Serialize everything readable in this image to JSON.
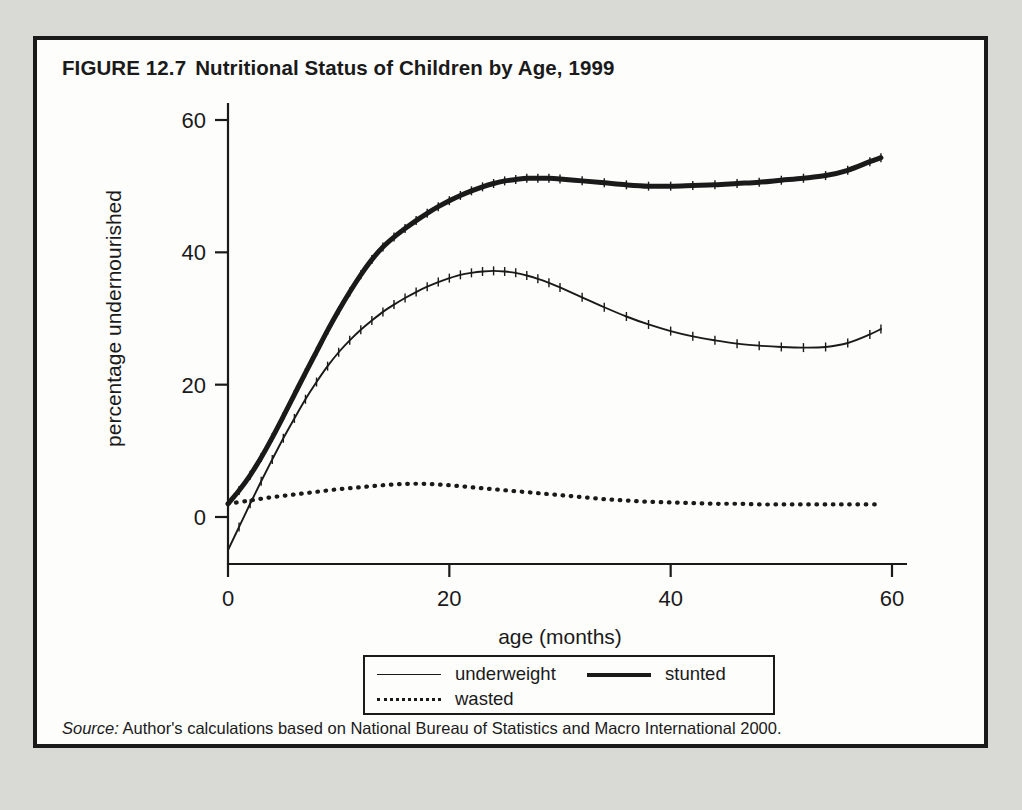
{
  "figure": {
    "number": "FIGURE 12.7",
    "title": "Nutritional Status of Children by Age, 1999",
    "source_word": "Source:",
    "source_text": " Author's calculations based on National Bureau of Statistics and Macro International 2000."
  },
  "legend": {
    "items": [
      {
        "label": "underweight",
        "style": "thin-solid"
      },
      {
        "label": "stunted",
        "style": "thick-solid"
      },
      {
        "label": "wasted",
        "style": "dotted"
      }
    ]
  },
  "colors": {
    "ink": "#1a1a1a",
    "page_background": "#d9d9d5",
    "figure_background": "#fdfdfc"
  },
  "chart_data": {
    "type": "line",
    "title": "Nutritional Status of Children by Age, 1999",
    "xlabel": "age (months)",
    "ylabel": "percentage undernourished",
    "xlim": [
      0,
      60
    ],
    "ylim": [
      -7,
      62
    ],
    "xticks": [
      0,
      20,
      40,
      60
    ],
    "yticks": [
      0,
      20,
      40,
      60
    ],
    "xtick_labels": [
      "0",
      "20",
      "40",
      "60"
    ],
    "ytick_labels": [
      "0",
      "20",
      "40",
      "60"
    ],
    "grid": false,
    "legend_position": "below-axes",
    "axes_spines": [
      "left",
      "bottom"
    ],
    "error_ticks": true,
    "series": [
      {
        "name": "stunted",
        "style": "thick-solid",
        "x": [
          0,
          1,
          2,
          3,
          4,
          5,
          6,
          7,
          8,
          9,
          10,
          11,
          12,
          13,
          14,
          15,
          16,
          17,
          18,
          19,
          20,
          21,
          22,
          23,
          24,
          25,
          26,
          27,
          28,
          29,
          30,
          32,
          34,
          36,
          38,
          40,
          42,
          44,
          46,
          48,
          50,
          52,
          54,
          56,
          58,
          59
        ],
        "values": [
          2.0,
          4.0,
          6.3,
          9.0,
          12.0,
          15.2,
          18.5,
          21.8,
          25.0,
          28.2,
          31.2,
          34.0,
          36.6,
          38.9,
          40.8,
          42.3,
          43.6,
          44.8,
          45.9,
          46.9,
          47.8,
          48.6,
          49.3,
          49.9,
          50.4,
          50.8,
          51.0,
          51.2,
          51.2,
          51.2,
          51.1,
          50.8,
          50.5,
          50.2,
          50.0,
          50.0,
          50.1,
          50.2,
          50.4,
          50.6,
          50.9,
          51.2,
          51.6,
          52.4,
          53.7,
          54.3
        ]
      },
      {
        "name": "underweight",
        "style": "thin-solid",
        "x": [
          0,
          1,
          2,
          3,
          4,
          5,
          6,
          7,
          8,
          9,
          10,
          11,
          12,
          13,
          14,
          15,
          16,
          17,
          18,
          19,
          20,
          21,
          22,
          23,
          24,
          25,
          26,
          27,
          28,
          29,
          30,
          32,
          34,
          36,
          38,
          40,
          42,
          44,
          46,
          48,
          50,
          52,
          54,
          56,
          58,
          59
        ],
        "values": [
          -5.0,
          -1.5,
          2.0,
          5.4,
          8.7,
          11.9,
          14.9,
          17.8,
          20.4,
          22.8,
          24.9,
          26.7,
          28.3,
          29.7,
          31.0,
          32.1,
          33.1,
          34.0,
          34.8,
          35.5,
          36.1,
          36.6,
          36.9,
          37.1,
          37.2,
          37.1,
          36.9,
          36.5,
          36.0,
          35.4,
          34.7,
          33.2,
          31.7,
          30.3,
          29.1,
          28.1,
          27.3,
          26.7,
          26.2,
          25.9,
          25.7,
          25.6,
          25.7,
          26.3,
          27.6,
          28.4
        ]
      },
      {
        "name": "wasted",
        "style": "dotted",
        "x": [
          0,
          2,
          4,
          6,
          8,
          10,
          12,
          14,
          16,
          18,
          20,
          22,
          24,
          26,
          28,
          30,
          32,
          34,
          36,
          38,
          40,
          42,
          44,
          46,
          48,
          50,
          52,
          54,
          56,
          58,
          59
        ],
        "values": [
          2.0,
          2.5,
          3.0,
          3.4,
          3.8,
          4.2,
          4.5,
          4.8,
          5.0,
          5.0,
          4.8,
          4.5,
          4.2,
          3.9,
          3.6,
          3.3,
          3.0,
          2.7,
          2.5,
          2.3,
          2.2,
          2.1,
          2.0,
          2.0,
          1.9,
          1.9,
          1.9,
          1.9,
          1.9,
          1.9,
          1.9
        ]
      }
    ]
  }
}
